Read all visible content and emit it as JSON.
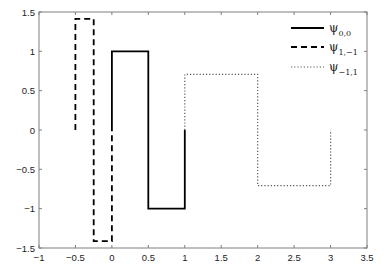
{
  "chart_data": {
    "type": "line",
    "title": "",
    "xlabel": "",
    "ylabel": "",
    "xlim": [
      -1,
      3.5
    ],
    "ylim": [
      -1.5,
      1.5
    ],
    "grid": false,
    "legend_position": "upper right",
    "xticks": [
      -1,
      -0.5,
      0,
      0.5,
      1,
      1.5,
      2,
      2.5,
      3,
      3.5
    ],
    "xtick_labels": [
      "-1",
      "-0.5",
      "0",
      "0.5",
      "1",
      "1.5",
      "2",
      "2.5",
      "3",
      "3.5"
    ],
    "yticks": [
      1.5,
      1,
      0.5,
      0,
      -0.5,
      -1,
      -1.5
    ],
    "ytick_labels": [
      "1.5",
      "1",
      "0.5",
      "0",
      "-0.5",
      "-1",
      "-1.5"
    ],
    "series": [
      {
        "name": "ψ_{0,0}",
        "label_base": "ψ",
        "label_sub": "0,0",
        "style": "solid",
        "color": "#000000",
        "x": [
          0,
          0,
          0.5,
          0.5,
          1,
          1
        ],
        "y": [
          0,
          1,
          1,
          -1,
          -1,
          0
        ]
      },
      {
        "name": "ψ_{1,-1}",
        "label_base": "ψ",
        "label_sub": "1,−1",
        "style": "dashed",
        "color": "#000000",
        "x": [
          -0.5,
          -0.5,
          -0.25,
          -0.25,
          0,
          0
        ],
        "y": [
          0,
          1.414,
          1.414,
          -1.414,
          -1.414,
          0
        ]
      },
      {
        "name": "ψ_{-1,1}",
        "label_base": "ψ",
        "label_sub": "−1,1",
        "style": "dotted",
        "color": "#555555",
        "x": [
          1,
          1,
          2,
          2,
          3,
          3
        ],
        "y": [
          0,
          0.707,
          0.707,
          -0.707,
          -0.707,
          0
        ]
      }
    ]
  }
}
